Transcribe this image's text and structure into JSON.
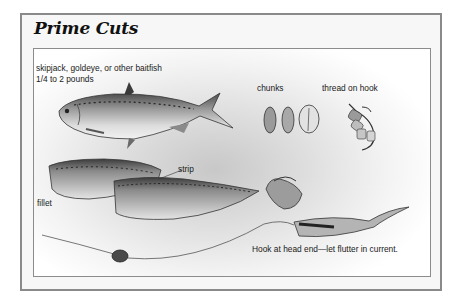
{
  "title": "Prime Cuts",
  "labels": {
    "baitfish": "skipjack, goldeye, or other baitfish",
    "weight": "1/4 to 2 pounds",
    "chunks": "chunks",
    "thread": "thread on hook",
    "strip": "strip",
    "fillet": "fillet",
    "hook_caption": "Hook at head end—let flutter in current."
  },
  "illustrations": [
    "whole-baitfish",
    "fillet",
    "strip",
    "chunks",
    "chunks-threaded-on-hook",
    "strip-hooked",
    "strip-on-line-with-sinker"
  ],
  "colors": {
    "border": "#8a8a8a",
    "panel": "#f7f7f7",
    "text": "#111111"
  }
}
